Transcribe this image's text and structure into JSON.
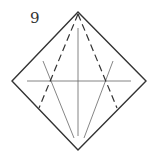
{
  "diagram": {
    "step_number": "9",
    "colors": {
      "outline": "#333333",
      "crease": "#666666",
      "valley_dashed": "#333333",
      "background": "#ffffff"
    },
    "shape": "diamond square (origami base) with crease lines",
    "lines": {
      "outline": {
        "points": [
          [
            78,
            12
          ],
          [
            146,
            81
          ],
          [
            78,
            150
          ],
          [
            12,
            81
          ]
        ]
      },
      "horizontal_crease": {
        "from": [
          27,
          81
        ],
        "to": [
          131,
          81
        ]
      },
      "vertical_crease": {
        "from": [
          78,
          28
        ],
        "to": [
          78,
          136
        ]
      },
      "left_diagonal_crease": {
        "from": [
          43,
          61
        ],
        "to": [
          74,
          138
        ]
      },
      "right_diagonal_crease": {
        "from": [
          113,
          61
        ],
        "to": [
          84,
          138
        ]
      },
      "left_dashed_fold": {
        "from": [
          78,
          12
        ],
        "to": [
          39,
          108
        ]
      },
      "right_dashed_fold": {
        "from": [
          78,
          12
        ],
        "to": [
          117,
          108
        ]
      }
    }
  }
}
